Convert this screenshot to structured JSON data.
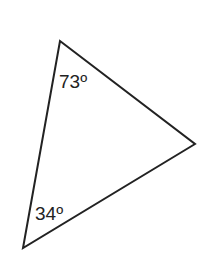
{
  "figure": {
    "type": "triangle",
    "stroke_color": "#222222",
    "vertices": {
      "top": [
        60,
        41
      ],
      "right": [
        195,
        144
      ],
      "bottom_left": [
        23,
        248
      ]
    },
    "angles": [
      {
        "vertex": "top",
        "label": "73º"
      },
      {
        "vertex": "bottom_left",
        "label": "34º"
      }
    ]
  }
}
